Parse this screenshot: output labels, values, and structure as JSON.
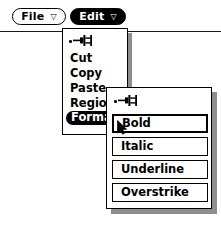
{
  "menubar": {
    "buttons": [
      {
        "label": "File",
        "indicator": "▽",
        "selected": false,
        "icon": "chevron-down-triangle-icon"
      },
      {
        "label": "Edit",
        "indicator": "▽",
        "selected": true,
        "icon": "chevron-down-triangle-icon"
      }
    ]
  },
  "edit_menu": {
    "pin_icon": "pushpin-unpinned-icon",
    "items": [
      {
        "label": "Cut",
        "selected": false
      },
      {
        "label": "Copy",
        "selected": false
      },
      {
        "label": "Paste",
        "selected": false
      },
      {
        "label": "Region",
        "selected": false
      },
      {
        "label": "Format",
        "selected": true
      }
    ]
  },
  "format_menu": {
    "pin_icon": "pushpin-unpinned-icon",
    "items": [
      {
        "label": "Bold",
        "border": "thick",
        "default": true
      },
      {
        "label": "Italic",
        "border": "medium",
        "default": false
      },
      {
        "label": "Underline",
        "border": "thin",
        "default": false
      },
      {
        "label": "Overstrike",
        "border": "thin",
        "default": false
      }
    ]
  },
  "cursor": {
    "icon": "arrow-pointer-icon",
    "x": 117,
    "y": 120
  },
  "colors": {
    "foreground": "#000000",
    "background": "#ffffff",
    "shadow": "#8e8e8e",
    "highlight_text": "#ffffff"
  }
}
